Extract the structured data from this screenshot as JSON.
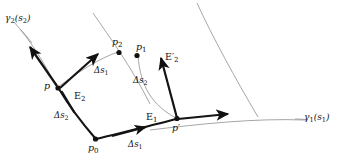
{
  "figure": {
    "kind": "differential-geometry-diagram",
    "background_color": "#ffffff",
    "ink_color": "#111111",
    "curve_color": "#8a8a8a",
    "width": 337,
    "height": 162
  },
  "curves": [
    {
      "name": "gamma2-coordinate-curve",
      "label": "γ2(s2)",
      "label_base": "γ",
      "label_sub": "2",
      "label_arg": "(s",
      "label_arg_sub": "2",
      "label_close": ")",
      "color": "#8a8a8a"
    },
    {
      "name": "gamma1-coordinate-curve",
      "label": "γ1(s1)",
      "label_base": "γ",
      "label_sub": "1",
      "label_arg": "(s",
      "label_arg_sub": "1",
      "label_close": ")",
      "color": "#8a8a8a"
    }
  ],
  "points": [
    {
      "id": "p0",
      "base": "p",
      "sub": "0",
      "prime": ""
    },
    {
      "id": "p",
      "base": "p",
      "sub": "",
      "prime": ""
    },
    {
      "id": "p1",
      "base": "p",
      "sub": "1",
      "prime": ""
    },
    {
      "id": "p2",
      "base": "p",
      "sub": "2",
      "prime": ""
    },
    {
      "id": "pprime",
      "base": "p",
      "sub": "",
      "prime": "′"
    }
  ],
  "vectors": [
    {
      "id": "E1",
      "base": "E",
      "sub": "1",
      "prime": ""
    },
    {
      "id": "E2",
      "base": "E",
      "sub": "2",
      "prime": ""
    },
    {
      "id": "E2p",
      "base": "E",
      "sub": "2",
      "prime": "′"
    }
  ],
  "increments": [
    {
      "id": "ds1-bottom",
      "base": "Δs",
      "sub": "1"
    },
    {
      "id": "ds1-top",
      "base": "Δs",
      "sub": "1"
    },
    {
      "id": "ds2-left",
      "base": "Δs",
      "sub": "2"
    },
    {
      "id": "ds2-right",
      "base": "Δs",
      "sub": "2"
    }
  ],
  "labels": {
    "gamma2_base": "γ",
    "gamma2_sub": "2",
    "gamma2_open": "(s",
    "gamma2_argsub": "2",
    "gamma2_close": ")",
    "gamma1_base": "γ",
    "gamma1_sub": "1",
    "gamma1_open": "(s",
    "gamma1_argsub": "1",
    "gamma1_close": ")",
    "p0_base": "p",
    "p0_sub": "0",
    "p1_base": "p",
    "p1_sub": "1",
    "p2_base": "p",
    "p2_sub": "2",
    "p_base": "p",
    "pprime_base": "p",
    "pprime_mark": "′",
    "E1_base": "E",
    "E1_sub": "1",
    "E2_base": "E",
    "E2_sub": "2",
    "E2p_base": "E",
    "E2p_mark": "′",
    "E2p_sub": "2",
    "ds1_base": "Δs",
    "ds1_sub": "1",
    "ds2_base": "Δs",
    "ds2_sub": "2"
  }
}
